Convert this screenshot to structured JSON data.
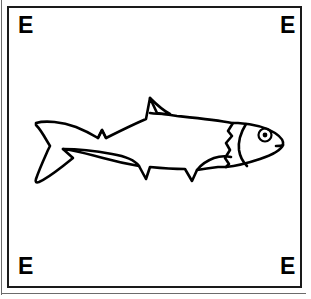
{
  "plate": {
    "width": 311,
    "height": 299,
    "background_color": "#ffffff",
    "ink_color": "#000000",
    "frame": {
      "name": "rectangular-border",
      "stroke_color": "#1a1a1a",
      "stroke_width": 2,
      "left": 7,
      "top": 6,
      "width": 295,
      "height": 282
    },
    "outer_rule_color": "#6b6b6b"
  },
  "corner_labels": {
    "top_left": "E",
    "top_right": "E",
    "bottom_left": "E",
    "bottom_right": "E"
  },
  "figure": {
    "style": "black-and-white line drawing",
    "orientation": "facing right",
    "parts": [
      "caudal-fin",
      "body-outline",
      "dorsal-fin",
      "adipose-notch",
      "anal-fin",
      "pelvic-fin",
      "pectoral-fin",
      "gill-cover",
      "preopercle-line",
      "eye",
      "pupil",
      "mouth"
    ],
    "bounds": {
      "left": 33,
      "top": 96,
      "right": 285,
      "bottom": 182
    }
  }
}
